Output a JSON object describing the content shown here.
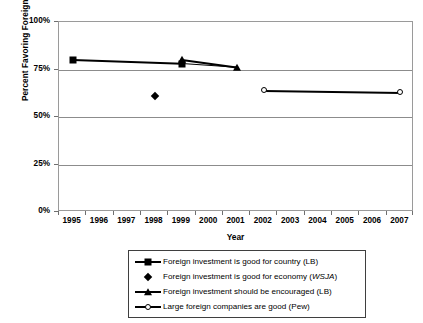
{
  "chart_data": {
    "type": "line",
    "title": "",
    "xlabel": "Year",
    "ylabel": "Percent Favoring Foreign Investment",
    "xlim": [
      1995,
      2007
    ],
    "ylim": [
      0,
      100
    ],
    "grid": true,
    "legend_position": "bottom",
    "categories": [
      "1995",
      "1996",
      "1997",
      "1998",
      "1999",
      "2000",
      "2001",
      "2002",
      "2003",
      "2004",
      "2005",
      "2006",
      "2007"
    ],
    "ytick_labels": [
      "100%",
      "75%",
      "50%",
      "25%",
      "0%"
    ],
    "ytick_values": [
      100,
      75,
      50,
      25,
      0
    ],
    "series": [
      {
        "name": "Foreign investment is good for country (LB)",
        "marker": "filled-square",
        "line": true,
        "points": [
          {
            "x": 1995,
            "y": 80
          },
          {
            "x": 1999,
            "y": 78
          }
        ]
      },
      {
        "name": "Foreign investment is good for economy (WSJA)",
        "marker": "filled-diamond",
        "line": false,
        "points": [
          {
            "x": 1998,
            "y": 61
          }
        ]
      },
      {
        "name": "Foreign investment should be encouraged (LB)",
        "marker": "filled-triangle",
        "line": true,
        "points": [
          {
            "x": 1999,
            "y": 80
          },
          {
            "x": 2001,
            "y": 76
          }
        ]
      },
      {
        "name": "Large foreign companies are good (Pew)",
        "marker": "open-circle",
        "line": true,
        "points": [
          {
            "x": 2002,
            "y": 64
          },
          {
            "x": 2007,
            "y": 63
          }
        ]
      }
    ]
  },
  "axes": {
    "y_title": "Percent Favoring Foreign Investment",
    "x_title": "Year",
    "y_ticks": [
      {
        "label": "100%",
        "value": 100
      },
      {
        "label": "75%",
        "value": 75
      },
      {
        "label": "50%",
        "value": 50
      },
      {
        "label": "25%",
        "value": 25
      },
      {
        "label": "0%",
        "value": 0
      }
    ],
    "x_ticks": [
      "1995",
      "1996",
      "1997",
      "1998",
      "1999",
      "2000",
      "2001",
      "2002",
      "2003",
      "2004",
      "2005",
      "2006",
      "2007"
    ]
  },
  "legend": {
    "items": [
      {
        "key": "line-square",
        "label": "Foreign investment is good for country (LB)",
        "label_plain": "Foreign investment is good for country (LB)",
        "emphasis": ""
      },
      {
        "key": "diamond",
        "label": "Foreign investment is good for economy (WSJA)",
        "label_prefix": "Foreign investment is good for economy (",
        "label_italic": "WSJA",
        "label_suffix": ")"
      },
      {
        "key": "line-triangle",
        "label": "Foreign investment should be encouraged (LB)",
        "emphasis": ""
      },
      {
        "key": "line-circle",
        "label": "Large foreign companies are good (Pew)",
        "emphasis": ""
      }
    ]
  },
  "colors": {
    "series": "#000000",
    "gridline": "#8c8c8c",
    "frame": "#9a9a9a",
    "background": "#ffffff"
  }
}
